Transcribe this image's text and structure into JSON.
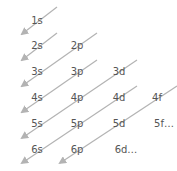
{
  "diagram": {
    "line_color": "#b3b3b3",
    "text_color": "#555555",
    "orbitals": [
      {
        "label": "1s",
        "x": 37,
        "y": 21
      },
      {
        "label": "2s",
        "x": 37,
        "y": 46
      },
      {
        "label": "2p",
        "x": 77,
        "y": 46
      },
      {
        "label": "3s",
        "x": 37,
        "y": 72
      },
      {
        "label": "3p",
        "x": 77,
        "y": 72
      },
      {
        "label": "3d",
        "x": 119,
        "y": 72
      },
      {
        "label": "4s",
        "x": 37,
        "y": 98
      },
      {
        "label": "4p",
        "x": 77,
        "y": 98
      },
      {
        "label": "4d",
        "x": 119,
        "y": 98
      },
      {
        "label": "4f",
        "x": 157,
        "y": 98
      },
      {
        "label": "5s",
        "x": 37,
        "y": 124
      },
      {
        "label": "5p",
        "x": 77,
        "y": 124
      },
      {
        "label": "5d",
        "x": 119,
        "y": 124
      },
      {
        "label": "5f…",
        "x": 164,
        "y": 124
      },
      {
        "label": "6s",
        "x": 37,
        "y": 150
      },
      {
        "label": "6p",
        "x": 77,
        "y": 150
      },
      {
        "label": "6d…",
        "x": 126,
        "y": 150
      }
    ],
    "arrows": [
      {
        "x1": 57,
        "y1": 7,
        "x2": 22,
        "y2": 34
      },
      {
        "x1": 57,
        "y1": 33,
        "x2": 22,
        "y2": 60
      },
      {
        "x1": 97,
        "y1": 33,
        "x2": 22,
        "y2": 86
      },
      {
        "x1": 97,
        "y1": 60,
        "x2": 22,
        "y2": 112
      },
      {
        "x1": 137,
        "y1": 60,
        "x2": 22,
        "y2": 138
      },
      {
        "x1": 137,
        "y1": 86,
        "x2": 22,
        "y2": 163
      },
      {
        "x1": 177,
        "y1": 86,
        "x2": 60,
        "y2": 163
      }
    ]
  }
}
